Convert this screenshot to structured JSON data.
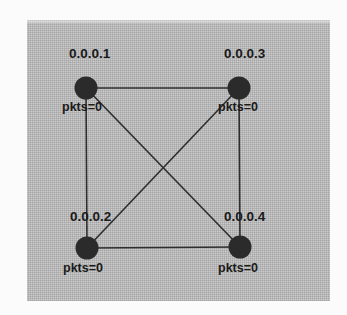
{
  "diagram": {
    "type": "network-topology",
    "title": "",
    "topology": "full-mesh",
    "canvas": {
      "background_color": "#b6b6b6",
      "outer_background_color": "#fbfbfb"
    },
    "node_color": "#2b2b2b",
    "edge_color": "#2e2e2e",
    "nodes": [
      {
        "id": "n1",
        "ip": "0.0.0.1",
        "stat": "pkts=0",
        "cx": 86,
        "cy": 88,
        "r": 11,
        "position": "top-left"
      },
      {
        "id": "n3",
        "ip": "0.0.0.3",
        "stat": "pkts=0",
        "cx": 239,
        "cy": 88,
        "r": 11,
        "position": "top-right"
      },
      {
        "id": "n2",
        "ip": "0.0.0.2",
        "stat": "pkts=0",
        "cx": 87,
        "cy": 248,
        "r": 11,
        "position": "bottom-left"
      },
      {
        "id": "n4",
        "ip": "0.0.0.4",
        "stat": "pkts=0",
        "cx": 240,
        "cy": 247,
        "r": 11,
        "position": "bottom-right"
      }
    ],
    "edges": [
      {
        "from": "n1",
        "to": "n3",
        "kind": "perimeter-top"
      },
      {
        "from": "n2",
        "to": "n4",
        "kind": "perimeter-bottom"
      },
      {
        "from": "n1",
        "to": "n2",
        "kind": "perimeter-left"
      },
      {
        "from": "n3",
        "to": "n4",
        "kind": "perimeter-right"
      },
      {
        "from": "n1",
        "to": "n4",
        "kind": "diagonal"
      },
      {
        "from": "n3",
        "to": "n2",
        "kind": "diagonal"
      }
    ]
  }
}
